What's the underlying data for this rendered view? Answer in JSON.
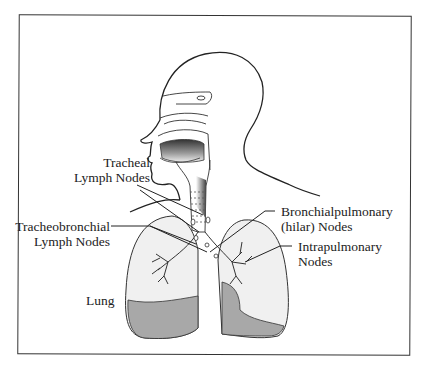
{
  "figure": {
    "type": "anatomical-diagram",
    "labels": {
      "tracheal": [
        "Tracheal",
        "Lymph Nodes"
      ],
      "tracheobronchial": [
        "Tracheobronchial",
        "Lymph Nodes"
      ],
      "lung": "Lung",
      "bronchopulmonary": [
        "Bronchialpulmonary",
        "(hilar) Nodes"
      ],
      "intrapulmonary": [
        "Intrapulmonary",
        "Nodes"
      ]
    },
    "colors": {
      "line": "#222222",
      "lung_fill": "#eeeeee",
      "lung_shade": "#a8a8a8",
      "frame": "#333333"
    }
  }
}
